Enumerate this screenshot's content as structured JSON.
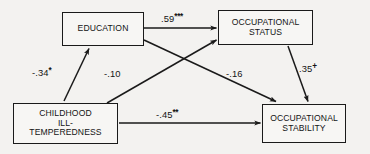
{
  "figure": {
    "type": "path-diagram",
    "background_color": "#f3f2f0",
    "line_color": "#1a1a1a"
  },
  "nodes": [
    {
      "id": "education",
      "label": "EDUCATION",
      "position": "top-left"
    },
    {
      "id": "occupational_status",
      "label": "OCCUPATIONAL\nSTATUS",
      "position": "top-right"
    },
    {
      "id": "childhood_ill_temperedness",
      "label": "CHILDHOOD\nILL-\nTEMPEREDNESS",
      "position": "bottom-left"
    },
    {
      "id": "occupational_stability",
      "label": "OCCUPATIONAL\nSTABILITY",
      "position": "bottom-right"
    }
  ],
  "paths": [
    {
      "id": "edu_to_status",
      "from": "education",
      "to": "occupational_status",
      "coefficient": ".59",
      "significance": "***",
      "value": 0.59
    },
    {
      "id": "ill_to_edu",
      "from": "childhood_ill_temperedness",
      "to": "education",
      "coefficient": "-.34",
      "significance": "*",
      "value": -0.34
    },
    {
      "id": "ill_to_status",
      "from": "childhood_ill_temperedness",
      "to": "occupational_status",
      "coefficient": "-.10",
      "significance": "",
      "value": -0.1
    },
    {
      "id": "edu_to_stability",
      "from": "education",
      "to": "occupational_stability",
      "coefficient": "-.16",
      "significance": "",
      "value": -0.16
    },
    {
      "id": "status_to_stability",
      "from": "occupational_status",
      "to": "occupational_stability",
      "coefficient": ".35",
      "significance": "+",
      "value": 0.35
    },
    {
      "id": "ill_to_stability",
      "from": "childhood_ill_temperedness",
      "to": "occupational_stability",
      "coefficient": "-.45",
      "significance": "**",
      "value": -0.45
    }
  ]
}
